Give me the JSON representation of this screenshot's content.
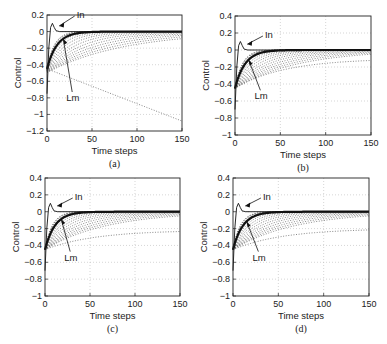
{
  "figure": {
    "panels": [
      {
        "id": "a",
        "caption": "(a)",
        "box": [
          47,
          15,
          182,
          131
        ]
      },
      {
        "id": "b",
        "caption": "(b)",
        "box": [
          235,
          16,
          371,
          135
        ]
      },
      {
        "id": "c",
        "caption": "(c)",
        "box": [
          45,
          178,
          180,
          296
        ]
      },
      {
        "id": "d",
        "caption": "(d)",
        "box": [
          233,
          178,
          369,
          296
        ]
      }
    ]
  },
  "chart_data": [
    {
      "type": "line",
      "title": "",
      "caption": "(a)",
      "xlabel": "Time steps",
      "ylabel": "Control",
      "xlim": [
        0,
        150
      ],
      "ylim": [
        -1.2,
        0.2
      ],
      "xticks": [
        0,
        50,
        100,
        150
      ],
      "yticks": [
        0.2,
        0,
        -0.2,
        -0.4,
        -0.6,
        -0.8,
        -1,
        -1.2
      ],
      "ytick_labels": [
        "0.2",
        "0",
        "-0.2",
        "-0.4",
        "-0.6",
        "-0.8",
        "-1",
        "-1.2"
      ],
      "grid": true,
      "annotations": [
        {
          "text": "In",
          "x": 8,
          "y": 0.08
        },
        {
          "text": "Lm",
          "x": 18,
          "y": -0.13
        }
      ],
      "series": [
        {
          "name": "In",
          "style": "thin solid",
          "x": [
            0,
            2,
            4,
            6,
            8,
            10,
            14,
            20,
            150
          ],
          "values": [
            -0.75,
            -0.2,
            0.05,
            0.1,
            0.05,
            0.01,
            0.0,
            0.0,
            0.0
          ]
        },
        {
          "name": "Lm",
          "style": "thick solid",
          "x": [
            0,
            5,
            10,
            15,
            20,
            30,
            40,
            60,
            150
          ],
          "values": [
            -0.45,
            -0.3,
            -0.2,
            -0.12,
            -0.07,
            -0.02,
            -0.005,
            0.0,
            0.0
          ]
        },
        {
          "name": "iteration curves",
          "style": "dotted",
          "description": "family of slower converging curves starting near -0.45; slowest decreases linearly toward about -1.08 at t=150",
          "x": [
            0,
            150
          ],
          "values_slowest": [
            -0.45,
            -1.08
          ]
        }
      ]
    },
    {
      "type": "line",
      "caption": "(b)",
      "xlabel": "Time steps",
      "ylabel": "Control",
      "xlim": [
        0,
        150
      ],
      "ylim": [
        -1,
        0.4
      ],
      "xticks": [
        0,
        50,
        100,
        150
      ],
      "yticks": [
        0.4,
        0.2,
        0,
        -0.2,
        -0.4,
        -0.6,
        -0.8,
        -1
      ],
      "ytick_labels": [
        "0.4",
        "0.2",
        "0",
        "-0.2",
        "-0.4",
        "-0.6",
        "-0.8",
        "-1"
      ],
      "grid": true,
      "annotations": [
        {
          "text": "In",
          "x": 8,
          "y": 0.08
        },
        {
          "text": "Lm",
          "x": 15,
          "y": -0.13
        }
      ],
      "series": [
        {
          "name": "In",
          "style": "thin solid",
          "x": [
            0,
            2,
            4,
            6,
            8,
            10,
            14,
            20,
            150
          ],
          "values": [
            -0.7,
            -0.2,
            0.05,
            0.1,
            0.05,
            0.01,
            0.0,
            0.0,
            0.0
          ]
        },
        {
          "name": "Lm",
          "style": "thick solid",
          "x": [
            0,
            5,
            10,
            15,
            20,
            30,
            40,
            60,
            150
          ],
          "values": [
            -0.45,
            -0.3,
            -0.2,
            -0.12,
            -0.07,
            -0.02,
            -0.005,
            0.0,
            0.0
          ]
        },
        {
          "name": "iteration curves",
          "style": "dotted",
          "description": "slower curves converging to 0; slowest reaches about -0.1 at t=150"
        }
      ]
    },
    {
      "type": "line",
      "caption": "(c)",
      "xlabel": "Time steps",
      "ylabel": "Control",
      "xlim": [
        0,
        150
      ],
      "ylim": [
        -1,
        0.4
      ],
      "xticks": [
        0,
        50,
        100,
        150
      ],
      "yticks": [
        0.4,
        0.2,
        0,
        -0.2,
        -0.4,
        -0.6,
        -0.8,
        -1
      ],
      "ytick_labels": [
        "0.4",
        "0.2",
        "0",
        "-0.2",
        "-0.4",
        "-0.6",
        "-0.8",
        "-1"
      ],
      "grid": true,
      "annotations": [
        {
          "text": "In",
          "x": 8,
          "y": 0.08
        },
        {
          "text": "Lm",
          "x": 18,
          "y": -0.13
        }
      ],
      "series": [
        {
          "name": "In",
          "style": "thin solid",
          "x": [
            0,
            2,
            4,
            6,
            8,
            10,
            14,
            20,
            150
          ],
          "values": [
            -0.7,
            -0.2,
            0.05,
            0.1,
            0.05,
            0.01,
            0.0,
            0.0,
            0.0
          ]
        },
        {
          "name": "Lm",
          "style": "thick solid",
          "x": [
            0,
            5,
            10,
            15,
            20,
            30,
            40,
            60,
            150
          ],
          "values": [
            -0.45,
            -0.3,
            -0.2,
            -0.12,
            -0.07,
            -0.02,
            -0.005,
            0.0,
            0.0
          ]
        },
        {
          "name": "iteration curves",
          "style": "dotted",
          "description": "slower curves converging to 0; slowest reaches about -0.2 at t=150"
        }
      ]
    },
    {
      "type": "line",
      "caption": "(d)",
      "xlabel": "Time steps",
      "ylabel": "Control",
      "xlim": [
        0,
        150
      ],
      "ylim": [
        -1,
        0.4
      ],
      "xticks": [
        0,
        50,
        100,
        150
      ],
      "yticks": [
        0.4,
        0.2,
        0,
        -0.2,
        -0.4,
        -0.6,
        -0.8,
        -1
      ],
      "ytick_labels": [
        "0.4",
        "0.2",
        "0",
        "-0.2",
        "-0.4",
        "-0.6",
        "-0.8",
        "-1"
      ],
      "grid": true,
      "annotations": [
        {
          "text": "In",
          "x": 8,
          "y": 0.08
        },
        {
          "text": "Lm",
          "x": 15,
          "y": -0.13
        }
      ],
      "series": [
        {
          "name": "In",
          "style": "thin solid",
          "x": [
            0,
            2,
            4,
            6,
            8,
            10,
            14,
            20,
            150
          ],
          "values": [
            -0.7,
            -0.2,
            0.05,
            0.1,
            0.05,
            0.01,
            0.0,
            0.0,
            0.0
          ]
        },
        {
          "name": "Lm",
          "style": "thick solid",
          "x": [
            0,
            5,
            10,
            15,
            20,
            30,
            40,
            60,
            150
          ],
          "values": [
            -0.45,
            -0.3,
            -0.2,
            -0.12,
            -0.07,
            -0.02,
            -0.005,
            0.0,
            0.0
          ]
        },
        {
          "name": "iteration curves",
          "style": "dotted",
          "description": "slower curves converging to 0; slowest reaches about -0.2 at t=150"
        }
      ]
    }
  ]
}
